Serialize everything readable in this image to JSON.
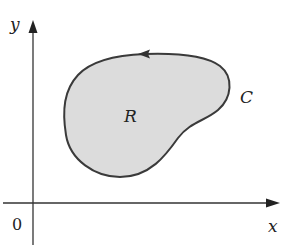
{
  "diagram": {
    "axes": {
      "x_label": "x",
      "y_label": "y",
      "origin_label": "0"
    },
    "region": {
      "label": "R",
      "fill": "#dcdcdc"
    },
    "curve": {
      "label": "C",
      "stroke": "#333333",
      "orientation": "counterclockwise"
    }
  }
}
